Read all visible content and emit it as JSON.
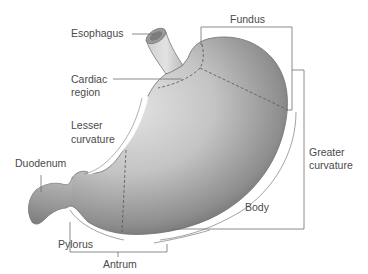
{
  "diagram": {
    "colors": {
      "organ_light": "#d9d9d9",
      "organ_mid": "#a8a8a8",
      "organ_dark": "#6a6a6a",
      "outline": "#7a7a7a",
      "leader_line": "#6e6e6e",
      "text": "#4a4a4a",
      "background": "#ffffff"
    },
    "labels": {
      "esophagus": "Esophagus",
      "fundus": "Fundus",
      "cardiac_line1": "Cardiac",
      "cardiac_line2": "region",
      "lesser_line1": "Lesser",
      "lesser_line2": "curvature",
      "duodenum": "Duodenum",
      "greater_line1": "Greater",
      "greater_line2": "curvature",
      "body": "Body",
      "pylorus": "Pylorus",
      "antrum": "Antrum"
    }
  }
}
